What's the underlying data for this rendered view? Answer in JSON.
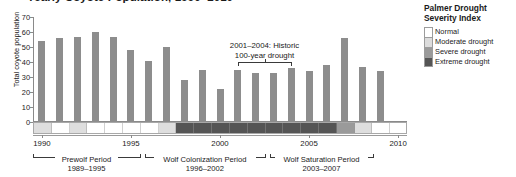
{
  "title": "Yearly Coyote Population, 1990–2010",
  "legend": {
    "title_line1": "Palmer Drought",
    "title_line2": "Severity Index",
    "items": [
      {
        "label": "Normal",
        "color": "#ffffff"
      },
      {
        "label": "Moderate drought",
        "color": "#dcdcdc"
      },
      {
        "label": "Severe drought",
        "color": "#9a9a9a"
      },
      {
        "label": "Extreme drought",
        "color": "#555555"
      }
    ]
  },
  "annotation": {
    "line1": "2001–2004: Historic",
    "line2": "100-year drought",
    "start_year": 2001,
    "end_year": 2004
  },
  "periods": [
    {
      "name": "Prewolf Period",
      "years": "1989–1995",
      "start": 1989.5,
      "end": 1995.5
    },
    {
      "name": "Wolf Colonization Period",
      "years": "1996–2002",
      "start": 1995.8,
      "end": 2002.5
    },
    {
      "name": "Wolf Saturation Period",
      "years": "2003–2007",
      "start": 2002.8,
      "end": 2008.6
    }
  ],
  "chart_data": {
    "type": "bar",
    "title": "Yearly Coyote Population, 1990–2010",
    "xlabel": "",
    "ylabel": "Total coyote population",
    "ylim": [
      0,
      70
    ],
    "yticks": [
      0,
      10,
      20,
      30,
      40,
      50,
      60,
      70
    ],
    "xlim": [
      1989.5,
      2010.5
    ],
    "xticks": [
      1990,
      1995,
      2000,
      2005,
      2010
    ],
    "grid": false,
    "legend_position": "right",
    "bar_color": "#8d8d8d",
    "categories": [
      1990,
      1991,
      1992,
      1993,
      1994,
      1995,
      1996,
      1997,
      1998,
      1999,
      2000,
      2001,
      2002,
      2003,
      2004,
      2005,
      2006,
      2007,
      2008,
      2009
    ],
    "values": [
      54,
      56,
      57,
      60,
      57,
      48,
      41,
      50,
      28,
      35,
      22,
      35,
      33,
      33,
      36,
      34,
      38,
      56,
      37,
      34
    ],
    "drought_index": [
      {
        "year": 1990,
        "level": "Moderate drought",
        "color": "#dedede"
      },
      {
        "year": 1991,
        "level": "Normal",
        "color": "#ffffff"
      },
      {
        "year": 1992,
        "level": "Moderate drought",
        "color": "#dedede"
      },
      {
        "year": 1993,
        "level": "Normal",
        "color": "#ffffff"
      },
      {
        "year": 1994,
        "level": "Normal",
        "color": "#ffffff"
      },
      {
        "year": 1995,
        "level": "Normal",
        "color": "#ffffff"
      },
      {
        "year": 1996,
        "level": "Normal",
        "color": "#ffffff"
      },
      {
        "year": 1997,
        "level": "Moderate drought",
        "color": "#dedede"
      },
      {
        "year": 1998,
        "level": "Extreme drought",
        "color": "#555555"
      },
      {
        "year": 1999,
        "level": "Extreme drought",
        "color": "#555555"
      },
      {
        "year": 2000,
        "level": "Extreme drought",
        "color": "#555555"
      },
      {
        "year": 2001,
        "level": "Extreme drought",
        "color": "#555555"
      },
      {
        "year": 2002,
        "level": "Extreme drought",
        "color": "#555555"
      },
      {
        "year": 2003,
        "level": "Extreme drought",
        "color": "#555555"
      },
      {
        "year": 2004,
        "level": "Extreme drought",
        "color": "#555555"
      },
      {
        "year": 2005,
        "level": "Extreme drought",
        "color": "#555555"
      },
      {
        "year": 2006,
        "level": "Extreme drought",
        "color": "#555555"
      },
      {
        "year": 2007,
        "level": "Severe drought",
        "color": "#9a9a9a"
      },
      {
        "year": 2008,
        "level": "Moderate drought",
        "color": "#dedede"
      },
      {
        "year": 2009,
        "level": "Normal",
        "color": "#ffffff"
      }
    ]
  }
}
